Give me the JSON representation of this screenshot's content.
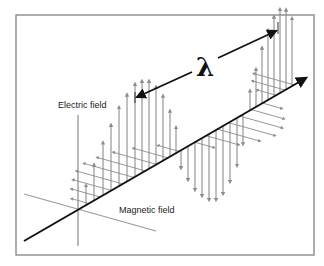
{
  "diagram": {
    "labels": {
      "electric_field": "Electric field",
      "magnetic_field": "Magnetic field",
      "wavelength_symbol": "λ"
    },
    "colors": {
      "frame": "#8a8a8a",
      "axis": "#111111",
      "field_arrows": "#8c8c8c",
      "magnetic_axis": "#9a9a9a"
    },
    "geometry": {
      "frame": {
        "x": 16,
        "y": 15,
        "w": 298,
        "h": 240
      },
      "origin": {
        "x": 78,
        "y": 210
      },
      "propagation_axis": {
        "x1": 24,
        "y1": 241,
        "x2": 306,
        "y2": 78
      },
      "electric_axis": {
        "x": 78,
        "y1": 115,
        "y2": 246
      },
      "magnetic_axis": {
        "x1": 24,
        "y1": 194,
        "x2": 156,
        "y2": 231
      },
      "wavelength_arrow": {
        "x1": 135,
        "y1": 98,
        "x2": 278,
        "y2": 30,
        "label_x": 206,
        "label_y": 72
      },
      "wavelength_ticks": [
        {
          "x": 135,
          "y1": 92,
          "y2": 103
        },
        {
          "x": 278,
          "y1": 22,
          "y2": 34
        }
      ]
    },
    "electric_field_arrows": [
      {
        "x": 86,
        "h": 20
      },
      {
        "x": 94,
        "h": 36
      },
      {
        "x": 103,
        "h": 53
      },
      {
        "x": 111,
        "h": 66
      },
      {
        "x": 119,
        "h": 79
      },
      {
        "x": 127,
        "h": 87
      },
      {
        "x": 135,
        "h": 93
      },
      {
        "x": 142,
        "h": 92
      },
      {
        "x": 149,
        "h": 88
      },
      {
        "x": 156,
        "h": 78
      },
      {
        "x": 163,
        "h": 65
      },
      {
        "x": 170,
        "h": 46
      },
      {
        "x": 176,
        "h": 26
      },
      {
        "x": 181,
        "h": -18
      },
      {
        "x": 188,
        "h": -34
      },
      {
        "x": 195,
        "h": -48
      },
      {
        "x": 202,
        "h": -58
      },
      {
        "x": 209,
        "h": -66
      },
      {
        "x": 216,
        "h": -70
      },
      {
        "x": 223,
        "h": -68
      },
      {
        "x": 230,
        "h": -60
      },
      {
        "x": 237,
        "h": -48
      },
      {
        "x": 243,
        "h": -30
      },
      {
        "x": 250,
        "h": 20
      },
      {
        "x": 256,
        "h": 38
      },
      {
        "x": 262,
        "h": 56
      },
      {
        "x": 268,
        "h": 70
      },
      {
        "x": 274,
        "h": 80
      },
      {
        "x": 280,
        "h": 84
      },
      {
        "x": 286,
        "h": 80
      },
      {
        "x": 292,
        "h": 68
      }
    ],
    "magnetic_field_arrows": [
      {
        "t": 0.05,
        "len": 18
      },
      {
        "t": 0.1,
        "len": 30
      },
      {
        "t": 0.15,
        "len": 40
      },
      {
        "t": 0.2,
        "len": 48
      },
      {
        "t": 0.25,
        "len": 52
      },
      {
        "t": 0.3,
        "len": 50
      },
      {
        "t": 0.35,
        "len": 45
      },
      {
        "t": 0.4,
        "len": 36
      },
      {
        "t": 0.45,
        "len": 22
      },
      {
        "t": 0.52,
        "len": -20
      },
      {
        "t": 0.57,
        "len": -34
      },
      {
        "t": 0.62,
        "len": -44
      },
      {
        "t": 0.67,
        "len": -48
      },
      {
        "t": 0.72,
        "len": -44
      },
      {
        "t": 0.77,
        "len": -34
      },
      {
        "t": 0.82,
        "len": -20
      },
      {
        "t": 0.88,
        "len": 20
      },
      {
        "t": 0.92,
        "len": 34
      },
      {
        "t": 0.96,
        "len": 42
      }
    ]
  }
}
